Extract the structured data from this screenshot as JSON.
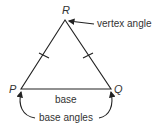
{
  "diagram": {
    "vertices": {
      "R": {
        "label": "R",
        "x": 65,
        "y": 20
      },
      "P": {
        "label": "P",
        "x": 21,
        "y": 89
      },
      "Q": {
        "label": "Q",
        "x": 111,
        "y": 89
      }
    },
    "labels": {
      "vertex_angle": "vertex angle",
      "base": "base",
      "base_angles": "base angles"
    },
    "congruent_sides": [
      "PR",
      "QR"
    ],
    "colors": {
      "line": "#222222",
      "text": "#333333",
      "background": "#ffffff"
    }
  }
}
